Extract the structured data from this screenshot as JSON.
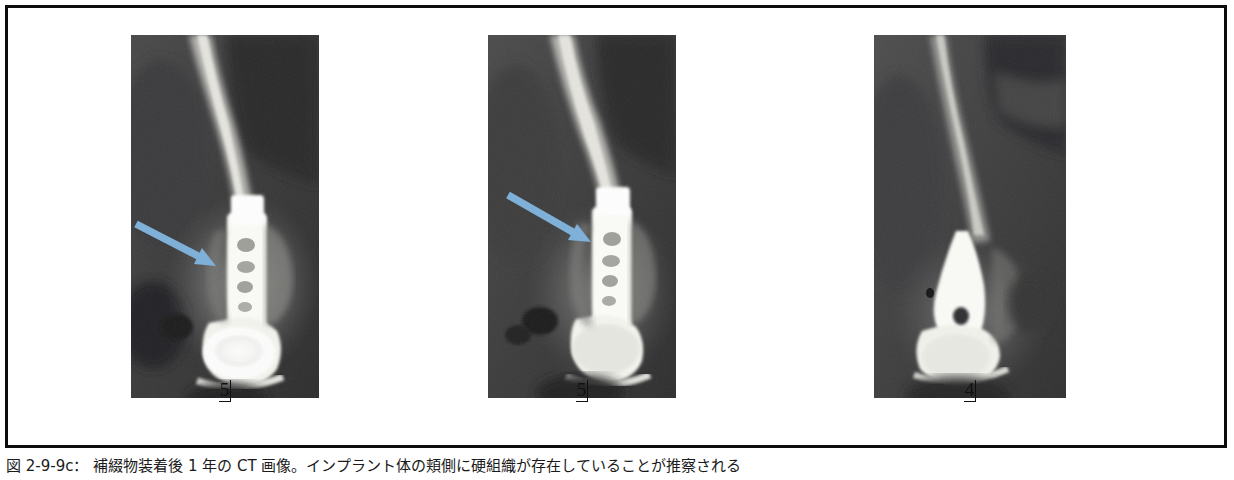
{
  "figure": {
    "caption": "図 2-9-9c： 補綴物装着後 1 年の CT 画像。インプラント体の頬側に硬組織が存在していることが推察される",
    "frame_color": "#0c0c0c",
    "arrow_color": "#7eb0d8",
    "panels": [
      {
        "id": "panel-1",
        "tooth_label": "5",
        "modality": "CT",
        "has_arrow": true,
        "arrow_label": "buccal-hard-tissue-arrow",
        "description": "インプラント体と上部構造の矢状断CT画像・頬側硬組織を矢印で示す"
      },
      {
        "id": "panel-2",
        "tooth_label": "5",
        "modality": "CT",
        "has_arrow": true,
        "arrow_label": "buccal-hard-tissue-arrow",
        "description": "インプラント体と上部構造の矢状断CT画像・頬側硬組織を矢印で示す"
      },
      {
        "id": "panel-3",
        "tooth_label": "4",
        "modality": "CT",
        "has_arrow": false,
        "arrow_label": "",
        "description": "隣在歯部の矢状断CT画像"
      }
    ]
  }
}
